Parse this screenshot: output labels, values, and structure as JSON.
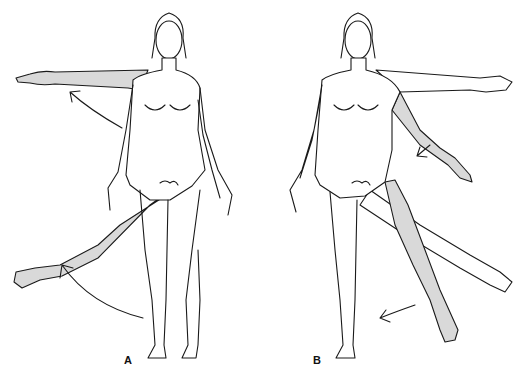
{
  "figure": {
    "panels": [
      {
        "label": "A",
        "description": "Abduction of right arm and right leg",
        "movement": "abduction"
      },
      {
        "label": "B",
        "description": "Adduction of left arm and left leg",
        "movement": "adduction"
      }
    ],
    "colors": {
      "line": "#1a1a1a",
      "shade": "#d9d9d9",
      "background": "#ffffff"
    }
  }
}
